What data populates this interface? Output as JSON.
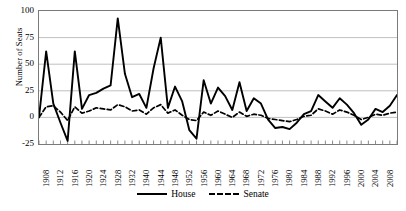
{
  "chart_data": {
    "type": "line",
    "title": "",
    "xlabel": "",
    "ylabel": "Number of Seats",
    "ylim": [
      -25,
      100
    ],
    "yticks": [
      100,
      75,
      50,
      25,
      0,
      -25
    ],
    "grid": true,
    "legend_position": "bottom-center",
    "x": [
      1908,
      1910,
      1912,
      1914,
      1916,
      1918,
      1920,
      1922,
      1924,
      1926,
      1928,
      1930,
      1932,
      1934,
      1936,
      1938,
      1940,
      1942,
      1944,
      1946,
      1948,
      1950,
      1952,
      1954,
      1956,
      1958,
      1960,
      1962,
      1964,
      1966,
      1968,
      1970,
      1972,
      1974,
      1976,
      1978,
      1980,
      1982,
      1984,
      1986,
      1988,
      1990,
      1992,
      1994,
      1996,
      1998,
      2000,
      2002,
      2004,
      2006,
      2008
    ],
    "xtick_labels": [
      "1908",
      "1912",
      "1916",
      "1920",
      "1924",
      "1928",
      "1932",
      "1940",
      "1944",
      "1948",
      "1952",
      "1956",
      "1960",
      "1964",
      "1968",
      "1972",
      "1976",
      "1980",
      "1984",
      "1988",
      "1992",
      "1996",
      "2000",
      "2004",
      "2008"
    ],
    "series": [
      {
        "name": "House",
        "style": "solid",
        "color": "#000000",
        "values": [
          0,
          62,
          13,
          -5,
          -22,
          62,
          8,
          21,
          23,
          27,
          30,
          93,
          41,
          19,
          22,
          9,
          46,
          75,
          9,
          29,
          15,
          -12,
          -20,
          35,
          13,
          28,
          20,
          7,
          33,
          6,
          18,
          13,
          -2,
          -10,
          -9,
          -11,
          -5,
          3,
          6,
          21,
          15,
          9,
          18,
          12,
          4,
          -7,
          -2,
          8,
          5,
          11,
          21
        ]
      },
      {
        "name": "Senate",
        "style": "dashed",
        "color": "#000000",
        "values": [
          0,
          10,
          11,
          5,
          -3,
          10,
          4,
          6,
          9,
          8,
          7,
          12,
          10,
          6,
          7,
          3,
          9,
          12,
          4,
          7,
          2,
          -2,
          -3,
          5,
          2,
          6,
          3,
          0,
          5,
          1,
          3,
          2,
          -1,
          -2,
          -3,
          -4,
          -2,
          1,
          2,
          8,
          6,
          3,
          7,
          5,
          2,
          -2,
          0,
          3,
          2,
          4,
          5
        ]
      }
    ]
  },
  "legend": {
    "house_label": "House",
    "senate_label": "Senate"
  }
}
